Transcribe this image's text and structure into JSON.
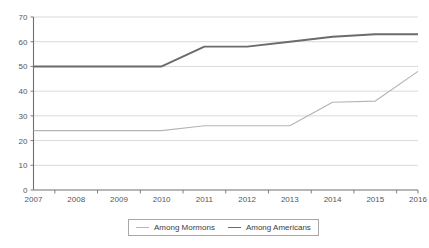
{
  "chart_data": {
    "type": "line",
    "title": "",
    "subtitle": "",
    "xlabel": "",
    "ylabel": "",
    "x": [
      2007,
      2008,
      2009,
      2010,
      2011,
      2012,
      2013,
      2014,
      2015,
      2016
    ],
    "categories": [
      "2007",
      "2008",
      "2009",
      "2010",
      "2011",
      "2012",
      "2013",
      "2014",
      "2015",
      "2016"
    ],
    "series": [
      {
        "name": "Among Mormons",
        "color": "#b5b5b5",
        "values": [
          24,
          24,
          24,
          24,
          26,
          26,
          26,
          35.5,
          36,
          48
        ]
      },
      {
        "name": "Among Americans",
        "color": "#6b6b6b",
        "values": [
          50,
          50,
          50,
          50,
          58,
          58,
          60,
          62,
          63,
          63
        ]
      }
    ],
    "xlim": [
      2007,
      2016
    ],
    "ylim": [
      0,
      70
    ],
    "yticks": [
      0,
      10,
      20,
      30,
      40,
      50,
      60,
      70
    ],
    "ytick_labels": [
      "0",
      "10",
      "20",
      "30",
      "40",
      "50",
      "60",
      "70"
    ],
    "grid": true,
    "grid_axis": "y",
    "legend_position": "bottom",
    "legend_entries": [
      "Among Mormons",
      "Among Americans"
    ]
  },
  "axes": {
    "y_axis_name": "y-axis",
    "x_axis_name": "x-axis"
  }
}
